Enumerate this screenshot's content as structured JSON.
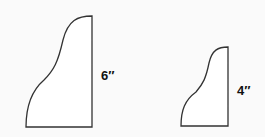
{
  "diagram": {
    "background": "#fafafa",
    "stroke_color": "#333333",
    "fill_color": "#ffffff",
    "shapes": [
      {
        "name": "large-shape",
        "label": "6″",
        "path": "M26,127 L92,127 L92,16 C78,16 68,20 63,40 C58,62 54,70 44,80 C30,92 26,108 26,127 Z"
      },
      {
        "name": "small-shape",
        "label": "4″",
        "path": "M181,126 L228,126 L228,47 C218,47 212,50 209,63 C206,78 203,84 196,92 C185,100 181,110 181,126 Z"
      }
    ]
  }
}
